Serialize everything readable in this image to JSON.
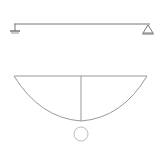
{
  "beam": {
    "loads": [
      {
        "label": "P",
        "x": 37
      },
      {
        "label": "P",
        "x": 59
      },
      {
        "label": "P",
        "x": 81
      },
      {
        "label": "P",
        "x": 103
      },
      {
        "label": "P",
        "x": 125
      }
    ],
    "segments": [
      "L/6",
      "L/6",
      "L/6",
      "L/6",
      "L/6",
      "L/6"
    ],
    "left_support": "pin",
    "right_support": "roller"
  },
  "moment_diagram": {
    "max_label": "9PL/12",
    "symbol": "M"
  },
  "colors": {
    "line": "#555555",
    "light_line": "#999999",
    "text": "#333333"
  }
}
